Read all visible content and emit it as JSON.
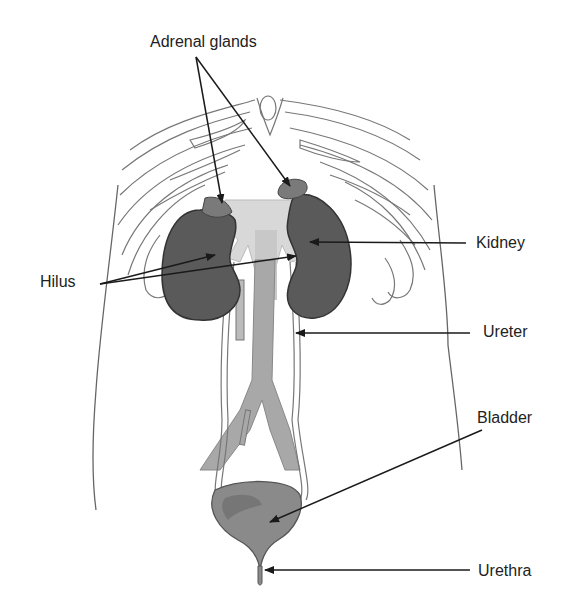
{
  "diagram": {
    "labels": {
      "adrenal_glands": "Adrenal glands",
      "kidney": "Kidney",
      "hilus": "Hilus",
      "ureter": "Ureter",
      "bladder": "Bladder",
      "urethra": "Urethra"
    },
    "colors": {
      "kidney_fill": "#5a5a5a",
      "adrenal_fill": "#7a7a7a",
      "vessel_fill": "#a8a8a8",
      "hilus_fill": "#d8d8d8",
      "bladder_fill": "#8a8a8a",
      "outline": "#555555",
      "arrow": "#1a1a1a"
    }
  }
}
